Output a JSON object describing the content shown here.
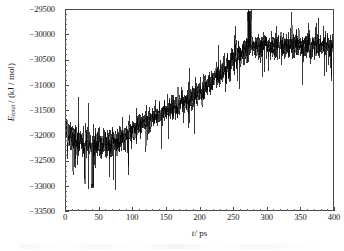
{
  "figure": {
    "background_color": "#ffffff",
    "line_color": "#000000",
    "axis_color": "#4a4a4a"
  },
  "axis_titles": {
    "y_symbol": "E",
    "y_subscript": "total",
    "y_units": "/ (kJ / mol)",
    "x_symbol": "t",
    "x_units": "/ ps"
  },
  "chart_data": {
    "type": "line",
    "title": "",
    "xlabel": "t / ps",
    "ylabel": "E_total / (kJ / mol)",
    "xlim": [
      0,
      400
    ],
    "ylim": [
      -33500,
      -29500
    ],
    "xticks": [
      0,
      50,
      100,
      150,
      200,
      250,
      300,
      350,
      400
    ],
    "xtick_labels": [
      "0",
      "50",
      "100",
      "150",
      "200",
      "250",
      "300",
      "350",
      "400"
    ],
    "yticks": [
      -33500,
      -33000,
      -32500,
      -32000,
      -31500,
      -31000,
      -30500,
      -30000,
      -29500
    ],
    "ytick_labels": [
      "−33500",
      "−33000",
      "−32500",
      "−32000",
      "−31500",
      "−31000",
      "−30500",
      "−30000",
      "−29500"
    ],
    "x_minor_tick_interval": 10,
    "y_minor_tick_interval": 100,
    "grid": false,
    "legend": null,
    "legend_position": "none",
    "series": [
      {
        "name": "Total energy",
        "color": "#000000",
        "line_width": 0.6,
        "description": "Noisy molecular-dynamics total-energy trace: fluctuating plateau near -32000 kJ/mol for 0-90 ps with a deep excursion to about -33050 kJ/mol near 40 ps, a steady rise between roughly 100 ps and 270 ps, then a high plateau near -30200 kJ/mol from 280-400 ps with peaks reaching -29500 kJ/mol.",
        "noise_amplitude_kJ_per_mol": 420,
        "baseline_points": {
          "x": [
            0,
            20,
            40,
            60,
            80,
            100,
            120,
            140,
            160,
            180,
            200,
            220,
            240,
            260,
            280,
            300,
            320,
            340,
            360,
            380,
            400
          ],
          "y": [
            -31980,
            -32120,
            -32230,
            -32180,
            -32060,
            -31900,
            -31760,
            -31600,
            -31450,
            -31320,
            -31160,
            -30900,
            -30640,
            -30400,
            -30240,
            -30200,
            -30210,
            -30190,
            -30210,
            -30200,
            -30190
          ]
        },
        "summary_statistics": {
          "initial_value": -31800,
          "minimum_value": -33050,
          "minimum_at_ps": 40,
          "maximum_value": -29500,
          "maximum_at_ps": 275,
          "final_value": -30200,
          "transition_start_ps": 100,
          "transition_end_ps": 275,
          "net_change": 1600
        }
      }
    ]
  }
}
